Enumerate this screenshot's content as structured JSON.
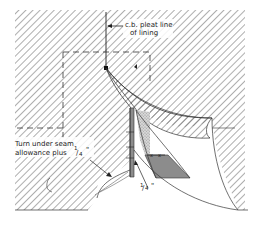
{
  "diagram": {
    "type": "sewing-pattern-illustration",
    "labels": {
      "pleat_line": "c.b. pleat line",
      "pleat_line_2": "of lining",
      "turn_under_1": "Turn under seam",
      "turn_under_2": "allowance plus",
      "turn_under_frac_num": "1",
      "turn_under_frac_den": "4",
      "turn_under_inch": "\"",
      "quarter_inch_num": "1",
      "quarter_inch_den": "4",
      "quarter_inch_mark": "\""
    },
    "colors": {
      "background": "#ffffff",
      "hatch": "#6a6a6a",
      "outline": "#333333",
      "shaded": "#8c8c8c",
      "stippled": "#c8c8c8"
    }
  }
}
